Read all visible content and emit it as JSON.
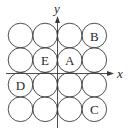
{
  "diagram": {
    "type": "circle-grid-with-axes",
    "grid": {
      "rows": 4,
      "cols": 4
    },
    "axes": {
      "x_label": "x",
      "y_label": "y"
    },
    "labeled_circles": [
      {
        "label": "B",
        "row": 1,
        "col": 4
      },
      {
        "label": "E",
        "row": 2,
        "col": 2
      },
      {
        "label": "A",
        "row": 2,
        "col": 3
      },
      {
        "label": "D",
        "row": 3,
        "col": 1
      },
      {
        "label": "C",
        "row": 4,
        "col": 4
      }
    ],
    "colors": {
      "stroke": "#3a3a3a",
      "text": "#2a2a2a",
      "background": "#ffffff"
    }
  }
}
